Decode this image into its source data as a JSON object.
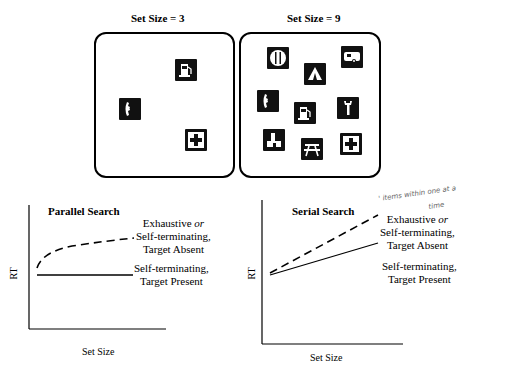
{
  "top_panels": [
    {
      "title": "Set Size = 3",
      "set_size": 3,
      "icons": [
        "gas-pump",
        "telephone",
        "first-aid-cross"
      ]
    },
    {
      "title": "Set Size = 9",
      "set_size": 9,
      "icons": [
        "restaurant-fork-knife",
        "tent-camping",
        "trailer-rv",
        "telephone",
        "gas-pump",
        "wrench",
        "lodging-house",
        "picnic-table",
        "first-aid-cross"
      ]
    }
  ],
  "graphs": [
    {
      "title": "Parallel Search",
      "ylabel": "RT",
      "xlabel": "Set Size",
      "dashed_label": {
        "line1": "Exhaustive",
        "or": "or",
        "line2": "Self-terminating,",
        "line3": "Target Absent"
      },
      "solid_label": {
        "line1": "Self-terminating,",
        "line2": "Target Present"
      }
    },
    {
      "title": "Serial Search",
      "ylabel": "RT",
      "xlabel": "Set Size",
      "dashed_label": {
        "line1": "Exhaustive",
        "or": "or",
        "line2": "Self-terminating,",
        "line3": "Target Absent"
      },
      "solid_label": {
        "line1": "Self-terminating,",
        "line2": "Target Present"
      },
      "annotation": "items one at a time"
    }
  ],
  "handwriting": {
    "line1": "' items within one at a",
    "line2": "time"
  }
}
